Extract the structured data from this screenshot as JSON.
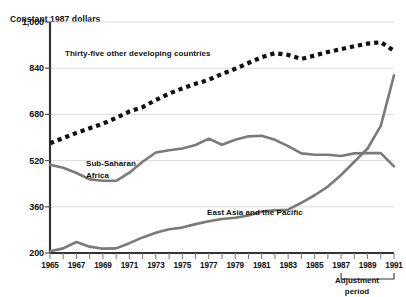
{
  "chart_data": {
    "type": "line",
    "title": "",
    "ylabel": "Constant 1987 dollars",
    "xlabel": "",
    "ylim": [
      200,
      1000
    ],
    "xlim": [
      1965,
      1991
    ],
    "grid": true,
    "yticks": [
      "200",
      "360",
      "520",
      "680",
      "840",
      "1,000"
    ],
    "ytick_values": [
      200,
      360,
      520,
      680,
      840,
      1000
    ],
    "xticks": [
      "1965",
      "1967",
      "1969",
      "1971",
      "1973",
      "1975",
      "1977",
      "1979",
      "1981",
      "1983",
      "1985",
      "1987",
      "1989",
      "1991"
    ],
    "xtick_values": [
      1965,
      1967,
      1969,
      1971,
      1973,
      1975,
      1977,
      1979,
      1981,
      1983,
      1985,
      1987,
      1989,
      1991
    ],
    "x": [
      1965,
      1966,
      1967,
      1968,
      1969,
      1970,
      1971,
      1972,
      1973,
      1974,
      1975,
      1976,
      1977,
      1978,
      1979,
      1980,
      1981,
      1982,
      1983,
      1984,
      1985,
      1986,
      1987,
      1988,
      1989,
      1990,
      1991
    ],
    "legend_position": "inline-annotations",
    "series": [
      {
        "name": "Thirty-five other developing countries",
        "style": "dotted",
        "color": "#111111",
        "label_position": {
          "x": 65,
          "y": 48
        },
        "values": [
          580,
          598,
          616,
          632,
          648,
          668,
          690,
          705,
          730,
          752,
          770,
          786,
          800,
          820,
          838,
          858,
          878,
          892,
          886,
          872,
          884,
          896,
          906,
          916,
          925,
          930,
          900
        ]
      },
      {
        "name": "Sub-Saharan Africa",
        "style": "solid",
        "color": "#7a7a7a",
        "label_position": {
          "x": 86,
          "y": 158
        },
        "values": [
          506,
          495,
          477,
          455,
          450,
          450,
          478,
          516,
          548,
          556,
          562,
          574,
          596,
          575,
          592,
          604,
          606,
          592,
          570,
          545,
          540,
          540,
          536,
          545,
          546,
          546,
          500
        ]
      },
      {
        "name": "East Asia and the Pacific",
        "style": "solid",
        "color": "#7a7a7a",
        "label_position": {
          "x": 207,
          "y": 207
        },
        "values": [
          206,
          216,
          238,
          222,
          215,
          216,
          234,
          254,
          270,
          282,
          288,
          300,
          310,
          318,
          322,
          330,
          344,
          348,
          350,
          374,
          400,
          430,
          470,
          516,
          562,
          640,
          815
        ]
      }
    ],
    "annotations": [
      {
        "name": "adjustment-period",
        "text": "Adjustment\nperiod",
        "bracket_from": 1987,
        "bracket_to": 1991,
        "label_x": 357,
        "label_y": 275
      }
    ]
  }
}
